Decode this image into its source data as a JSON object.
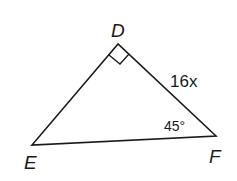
{
  "diagram": {
    "type": "right triangle",
    "vertices": {
      "D": {
        "label": "D",
        "x": 118,
        "y": 44
      },
      "E": {
        "label": "E",
        "x": 32,
        "y": 145
      },
      "F": {
        "label": "F",
        "x": 216,
        "y": 136
      }
    },
    "right_angle_at": "D",
    "side_label": {
      "side": "DF",
      "text": "16x"
    },
    "angle_label": {
      "vertex": "F",
      "text": "45°"
    },
    "colors": {
      "stroke": "#1a1a1a",
      "background": "#ffffff"
    }
  }
}
